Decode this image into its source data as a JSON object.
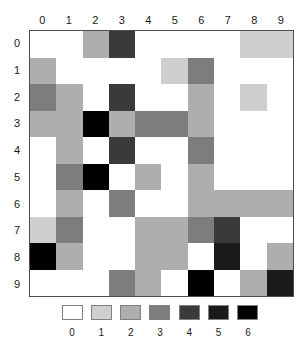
{
  "chart_data": {
    "type": "heatmap",
    "title": "",
    "xlabel": "",
    "ylabel": "",
    "grid": true,
    "legend_position": "bottom",
    "x_tick_labels": [
      "0",
      "1",
      "2",
      "3",
      "4",
      "5",
      "6",
      "7",
      "8",
      "9"
    ],
    "y_tick_labels": [
      "0",
      "1",
      "2",
      "3",
      "4",
      "5",
      "6",
      "7",
      "8",
      "9"
    ],
    "value_levels": [
      0,
      1,
      2,
      3,
      4,
      5,
      6
    ],
    "level_colors": [
      "#ffffff",
      "#cfcfcf",
      "#aeaeae",
      "#7d7d7d",
      "#3a3a3a",
      "#1a1a1a",
      "#000000"
    ],
    "values": [
      [
        0,
        0,
        2,
        4,
        0,
        0,
        0,
        0,
        1,
        1
      ],
      [
        2,
        0,
        0,
        0,
        0,
        1,
        3,
        0,
        0,
        0
      ],
      [
        3,
        2,
        0,
        4,
        0,
        0,
        2,
        0,
        1,
        0
      ],
      [
        2,
        2,
        6,
        2,
        3,
        3,
        2,
        0,
        0,
        0
      ],
      [
        0,
        2,
        0,
        4,
        0,
        0,
        3,
        0,
        0,
        0
      ],
      [
        0,
        3,
        6,
        0,
        2,
        0,
        2,
        0,
        0,
        0
      ],
      [
        0,
        2,
        0,
        3,
        0,
        0,
        2,
        2,
        2,
        2
      ],
      [
        1,
        3,
        0,
        0,
        2,
        2,
        3,
        4,
        0,
        0
      ],
      [
        6,
        2,
        0,
        0,
        2,
        2,
        0,
        5,
        0,
        2
      ],
      [
        0,
        0,
        0,
        3,
        2,
        0,
        6,
        0,
        2,
        5
      ]
    ]
  },
  "legend": {
    "labels": [
      "0",
      "1",
      "2",
      "3",
      "4",
      "5",
      "6"
    ]
  },
  "axes": {
    "columns": [
      "0",
      "1",
      "2",
      "3",
      "4",
      "5",
      "6",
      "7",
      "8",
      "9"
    ],
    "rows": [
      "0",
      "1",
      "2",
      "3",
      "4",
      "5",
      "6",
      "7",
      "8",
      "9"
    ]
  }
}
